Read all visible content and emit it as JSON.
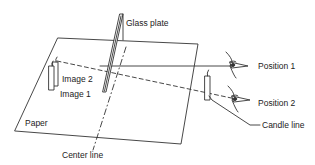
{
  "diagram": {
    "labels": {
      "glass_plate": "Glass plate",
      "image_2": "Image 2",
      "image_1": "Image 1",
      "paper": "Paper",
      "center_line": "Center line",
      "candle_line": "Candle line",
      "position_1": "Position 1",
      "position_2": "Position 2"
    },
    "colors": {
      "line": "#333333",
      "background": "#ffffff"
    }
  }
}
